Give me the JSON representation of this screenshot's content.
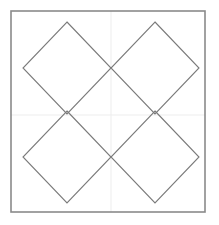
{
  "figure": {
    "canvas": {
      "width": 219,
      "height": 225,
      "background_color": "#ffffff"
    },
    "frame": {
      "label": "bounding-square",
      "x": 11,
      "y": 11,
      "width": 194,
      "height": 201,
      "stroke_color": "#8a8a8a",
      "stroke_width": 1.6,
      "fill": "none"
    },
    "gridlines": {
      "label": "center-crosshair",
      "stroke_color": "#ededed",
      "stroke_width": 1,
      "vertical_x": 111,
      "horizontal_y": 115,
      "vertical_y1": 11,
      "vertical_y2": 212,
      "horizontal_x1": 11,
      "horizontal_x2": 205
    },
    "diamonds": {
      "label": "rotated-squares",
      "stroke_color": "#7a7a7a",
      "stroke_width": 1.1,
      "fill": "none",
      "count": 4,
      "half_diagonal_x": 44,
      "half_diagonal_y": 46,
      "items": [
        {
          "name": "diamond-top-left",
          "center_x": 67,
          "center_y": 68,
          "points": "67,22 111,68 67,114 23,68"
        },
        {
          "name": "diamond-top-right",
          "center_x": 155,
          "center_y": 68,
          "points": "155,22 199,68 155,114 111,68"
        },
        {
          "name": "diamond-bottom-left",
          "center_x": 67,
          "center_y": 157,
          "points": "67,111 111,157 67,203 23,157"
        },
        {
          "name": "diamond-bottom-right",
          "center_x": 155,
          "center_y": 157,
          "points": "155,111 199,157 155,203 111,157"
        }
      ]
    }
  }
}
